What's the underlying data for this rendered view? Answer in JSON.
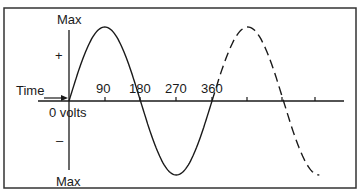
{
  "diagram": {
    "vertical_axis": {
      "top_label": "Max",
      "bottom_label": "Max",
      "positive_label": "+",
      "negative_label": "–",
      "zero_label": "0 volts"
    },
    "horizontal_axis": {
      "label": "Time",
      "ticks": [
        "90",
        "180",
        "270",
        "360"
      ],
      "extra_unlabeled_ticks": 3
    },
    "curves": [
      {
        "name": "first-cycle",
        "style": "solid",
        "range_degrees": [
          0,
          360
        ]
      },
      {
        "name": "continuation",
        "style": "dashed",
        "range_degrees": [
          360,
          630
        ]
      }
    ],
    "colors": {
      "line": "#1a1a1a",
      "background": "#ffffff",
      "border": "#333333"
    }
  }
}
